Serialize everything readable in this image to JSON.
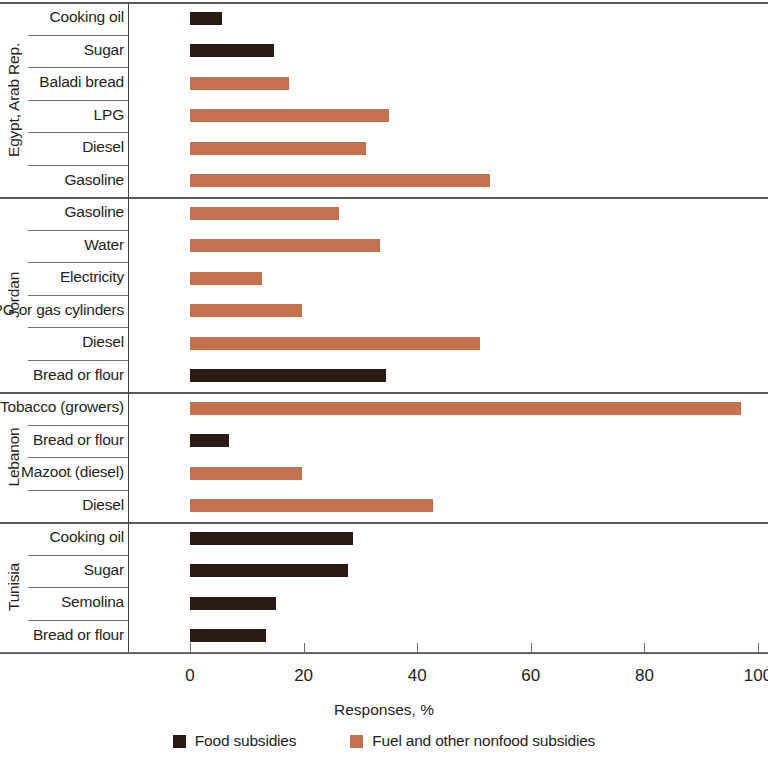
{
  "chart_data": {
    "type": "bar",
    "orientation": "horizontal",
    "title": "",
    "xlabel": "Responses, %",
    "ylabel": "",
    "xlim": [
      0,
      100
    ],
    "xticks": [
      0,
      20,
      40,
      60,
      80,
      100
    ],
    "xtick_labels": [
      "0",
      "20",
      "40",
      "60",
      "80",
      "100"
    ],
    "grid": false,
    "legend_position": "bottom",
    "legend": [
      {
        "name": "Food subsidies",
        "color": "#2a1a14"
      },
      {
        "name": "Fuel and other nonfood subsidies",
        "color": "#c4714d"
      }
    ],
    "groups": [
      {
        "name": "Egypt, Arab Rep.",
        "items": [
          {
            "category": "Cooking oil",
            "value": 5.6,
            "series": "Food subsidies"
          },
          {
            "category": "Sugar",
            "value": 14.8,
            "series": "Food subsidies"
          },
          {
            "category": "Baladi bread",
            "value": 17.4,
            "series": "Fuel and other nonfood subsidies"
          },
          {
            "category": "LPG",
            "value": 35.0,
            "series": "Fuel and other nonfood subsidies"
          },
          {
            "category": "Diesel",
            "value": 31.0,
            "series": "Fuel and other nonfood subsidies"
          },
          {
            "category": "Gasoline",
            "value": 52.8,
            "series": "Fuel and other nonfood subsidies"
          }
        ]
      },
      {
        "name": "Jordan",
        "items": [
          {
            "category": "Gasoline",
            "value": 26.2,
            "series": "Fuel and other nonfood subsidies"
          },
          {
            "category": "Water",
            "value": 33.4,
            "series": "Fuel and other nonfood subsidies"
          },
          {
            "category": "Electricity",
            "value": 12.7,
            "series": "Fuel and other nonfood subsidies"
          },
          {
            "category": "LPG or gas cylinders",
            "value": 19.8,
            "series": "Fuel and other nonfood subsidies"
          },
          {
            "category": "Diesel",
            "value": 51.0,
            "series": "Fuel and other nonfood subsidies"
          },
          {
            "category": "Bread or flour",
            "value": 34.5,
            "series": "Food subsidies"
          }
        ]
      },
      {
        "name": "Lebanon",
        "items": [
          {
            "category": "Tobacco (growers)",
            "value": 97.0,
            "series": "Fuel and other nonfood subsidies"
          },
          {
            "category": "Bread or flour",
            "value": 6.8,
            "series": "Food subsidies"
          },
          {
            "category": "Mazoot (diesel)",
            "value": 19.8,
            "series": "Fuel and other nonfood subsidies"
          },
          {
            "category": "Diesel",
            "value": 42.8,
            "series": "Fuel and other nonfood subsidies"
          }
        ]
      },
      {
        "name": "Tunisia",
        "items": [
          {
            "category": "Cooking oil",
            "value": 28.7,
            "series": "Food subsidies"
          },
          {
            "category": "Sugar",
            "value": 27.9,
            "series": "Food subsidies"
          },
          {
            "category": "Semolina",
            "value": 15.1,
            "series": "Food subsidies"
          },
          {
            "category": "Bread or flour",
            "value": 13.3,
            "series": "Food subsidies"
          }
        ]
      }
    ]
  }
}
